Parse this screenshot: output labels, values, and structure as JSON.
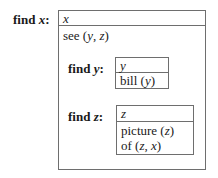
{
  "diagram": {
    "outer": {
      "label_prefix": "find ",
      "label_var": "x",
      "label_suffix": ":",
      "head": "x",
      "body_lines": [
        {
          "pred": "see ",
          "args": [
            "y",
            "z"
          ]
        }
      ]
    },
    "inner_y": {
      "label_prefix": "find ",
      "label_var": "y",
      "label_suffix": ":",
      "head": "y",
      "body_lines": [
        {
          "pred": "bill ",
          "args": [
            "y"
          ]
        }
      ]
    },
    "inner_z": {
      "label_prefix": "find ",
      "label_var": "z",
      "label_suffix": ":",
      "head": "z",
      "body_lines": [
        {
          "pred": "picture ",
          "args": [
            "z"
          ]
        },
        {
          "pred": "of ",
          "args": [
            "z",
            "x"
          ]
        }
      ]
    },
    "colors": {
      "border": "#6e6e6e",
      "text": "#1a1a1a",
      "background": "#ffffff"
    }
  }
}
